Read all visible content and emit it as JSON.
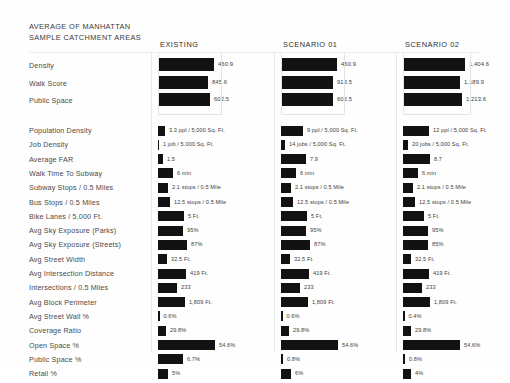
{
  "title": {
    "line1": "AVERAGE OF MANHATTAN",
    "line2": "SAMPLE CATCHMENT AREAS"
  },
  "columns": [
    {
      "id": "existing",
      "label": "EXISTING"
    },
    {
      "id": "scenario01",
      "label": "SCENARIO 01"
    },
    {
      "id": "scenario02",
      "label": "SCENARIO 02"
    }
  ],
  "colors": {
    "bar": "#121212",
    "text": "#3d3d3d",
    "rule": "#ececec",
    "background": "#ffffff"
  },
  "chart_data": {
    "type": "bar",
    "title": "AVERAGE OF MANHATTAN SAMPLE CATCHMENT AREAS",
    "xlabel": "",
    "ylabel": "",
    "legend_position": "top",
    "grid": false,
    "categories": [
      "Density",
      "Walk Score",
      "Public Space",
      "Population Density",
      "Job Density",
      "Average FAR",
      "Walk Time To Subway",
      "Subway Stops / 0.5 Miles",
      "Bus Stops / 0.5 Miles",
      "Bike Lanes / 5,000 Ft.",
      "Avg Sky Exposure (Parks)",
      "Avg Sky Exposure (Streets)",
      "Avg Street Width",
      "Avg Intersection Distance",
      "Intersections / 0.5 Miles",
      "Avg Block Perimeter",
      "Avg Street Wall %",
      "Coverage Ratio",
      "Open Space %",
      "Public Space %",
      "Retail %"
    ],
    "series": [
      {
        "name": "EXISTING",
        "values": [
          460.9,
          845.6,
          602.5,
          3.3,
          1,
          1.5,
          6,
          2.1,
          12.5,
          5,
          95,
          87,
          32.5,
          419,
          233,
          1809,
          0.6,
          29.8,
          54.6,
          6.7,
          5
        ],
        "labels": [
          "460.9",
          "845.6",
          "602.5",
          "3.3 ppl / 5,000 Sq. Ft.",
          "1 job / 5,000 Sq. Ft.",
          "1.5",
          "6 min",
          "2.1 stops / 0.5 Mile",
          "12.5 stops / 0.5 Mile",
          "5 Ft.",
          "95%",
          "87%",
          "32.5 Ft.",
          "419 Ft.",
          "233",
          "1,809 Ft.",
          "0.6%",
          "29.8%",
          "54.6%",
          "6.7%",
          "5%"
        ],
        "bar_widths": [
          56,
          50,
          52,
          7,
          1,
          5,
          15,
          10,
          12,
          26,
          25,
          29,
          9,
          28,
          19,
          27,
          1.5,
          8,
          57,
          25,
          10
        ]
      },
      {
        "name": "SCENARIO 01",
        "values": [
          460.9,
          913.5,
          602.5,
          9,
          14,
          7.9,
          6,
          2.1,
          12.5,
          5,
          95,
          87,
          32.5,
          419,
          233,
          1809,
          0.6,
          29.8,
          54.6,
          0.8,
          6
        ],
        "labels": [
          "460.9",
          "913.5",
          "602.5",
          "9 ppl / 5,000 Sq. Ft.",
          "14 jobs / 5,000 Sq. Ft.",
          "7.9",
          "6 min",
          "2.1 stops / 0.5 Mile",
          "12.5 stops / 0.5 Mile",
          "5 Ft.",
          "95%",
          "87%",
          "32.5 Ft.",
          "419 Ft.",
          "233",
          "1,809 Ft.",
          "0.6%",
          "29.8%",
          "54.6%",
          "0.8%",
          "6%"
        ],
        "bar_widths": [
          56,
          52,
          52,
          22,
          4,
          25,
          15,
          10,
          12,
          26,
          25,
          29,
          9,
          28,
          19,
          27,
          1.5,
          8,
          57,
          2,
          10
        ]
      },
      {
        "name": "SCENARIO 02",
        "values": [
          1404.6,
          1189.9,
          1213.6,
          12,
          20,
          8.7,
          6,
          2.1,
          12.5,
          5,
          95,
          85,
          32.5,
          419,
          233,
          1809,
          0.4,
          29.8,
          54.6,
          0.8,
          4
        ],
        "labels": [
          "1,404.6",
          "1,189.9",
          "1,213.6",
          "12 ppl / 5,000 Sq. Ft.",
          "20 jobs / 5,000 Sq. Ft.",
          "8.7",
          "6 min",
          "2.1 stops / 0.5 Mile",
          "12.5 stops / 0.5 Mile",
          "5 Ft.",
          "95%",
          "85%",
          "32.5 Ft.",
          "419 Ft.",
          "233",
          "1,809 Ft.",
          "0.4%",
          "29.8%",
          "54.6%",
          "0.8%",
          "4%"
        ],
        "bar_widths": [
          62,
          57,
          59,
          26,
          5,
          27,
          15,
          10,
          12,
          21,
          25,
          25,
          8,
          26,
          19,
          27,
          1.5,
          8,
          57,
          2,
          8
        ]
      }
    ],
    "group_breaks": [
      3
    ]
  }
}
